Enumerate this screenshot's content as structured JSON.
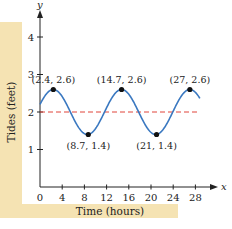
{
  "chart_data": {
    "type": "line",
    "title": "",
    "xlabel": "Time (hours)",
    "ylabel": "Tides (feet)",
    "x_axis_letter": "x",
    "y_axis_letter": "y",
    "xlim": [
      0,
      30
    ],
    "ylim": [
      0,
      4.5
    ],
    "x_ticks": [
      0,
      4,
      8,
      12,
      16,
      20,
      24,
      28
    ],
    "y_ticks": [
      1,
      2,
      3,
      4
    ],
    "grid": false,
    "curve": {
      "name": "tide",
      "color": "#3a78c0",
      "model": "y = 2 + 0.6*cos((2*pi/12.3)*(x-2.4))",
      "x_range": [
        0,
        30
      ]
    },
    "midline": {
      "y": 2,
      "color": "#e0443a",
      "style": "dashed"
    },
    "points": [
      {
        "x": 2.4,
        "y": 2.6,
        "label": "(2.4, 2.6)"
      },
      {
        "x": 8.7,
        "y": 1.4,
        "label": "(8.7, 1.4)"
      },
      {
        "x": 14.7,
        "y": 2.6,
        "label": "(14.7, 2.6)"
      },
      {
        "x": 21,
        "y": 1.4,
        "label": "(21, 1.4)"
      },
      {
        "x": 27,
        "y": 2.6,
        "label": "(27, 2.6)"
      }
    ]
  },
  "colors": {
    "panel": "#f5e3b3",
    "curve": "#3a78c0",
    "midline": "#e0443a",
    "axis": "#222222"
  }
}
